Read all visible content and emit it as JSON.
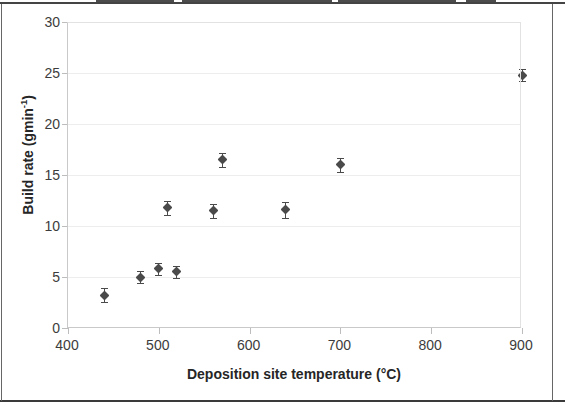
{
  "chart_data": {
    "type": "scatter",
    "title": "",
    "xlabel": "Deposition site temperature (°C)",
    "ylabel": "Build rate (gmin-1)",
    "ylabel_base": "Build rate (gmin",
    "ylabel_sup": "-1",
    "ylabel_close": ")",
    "xlim": [
      400,
      900
    ],
    "ylim": [
      0,
      30
    ],
    "xticks": [
      400,
      500,
      600,
      700,
      800,
      900
    ],
    "yticks": [
      0,
      5,
      10,
      15,
      20,
      25,
      30
    ],
    "xtick_labels": [
      "400",
      "500",
      "600",
      "700",
      "800",
      "900"
    ],
    "ytick_labels": [
      "0",
      "5",
      "10",
      "15",
      "20",
      "25",
      "30"
    ],
    "grid": "horizontal-light",
    "legend": "none",
    "marker": "diamond",
    "marker_color": "#4a4a4a",
    "error_bars": "vertical",
    "series": [
      {
        "name": "Build rate",
        "points": [
          {
            "x": 440,
            "y": 3.2,
            "yerr": 0.7
          },
          {
            "x": 480,
            "y": 5.0,
            "yerr": 0.6
          },
          {
            "x": 500,
            "y": 5.8,
            "yerr": 0.6
          },
          {
            "x": 520,
            "y": 5.5,
            "yerr": 0.6
          },
          {
            "x": 510,
            "y": 11.8,
            "yerr": 0.7
          },
          {
            "x": 560,
            "y": 11.5,
            "yerr": 0.7
          },
          {
            "x": 570,
            "y": 16.5,
            "yerr": 0.7
          },
          {
            "x": 640,
            "y": 11.6,
            "yerr": 0.8
          },
          {
            "x": 700,
            "y": 16.0,
            "yerr": 0.7
          },
          {
            "x": 900,
            "y": 24.8,
            "yerr": 0.6
          }
        ]
      }
    ]
  },
  "figure": {
    "axis_color": "#c9c9c9",
    "grid_color": "#ededed",
    "text_color": "#3c3c3c",
    "title_color": "#262626",
    "frame_color": "#3a3a3a",
    "background": "#ffffff"
  }
}
